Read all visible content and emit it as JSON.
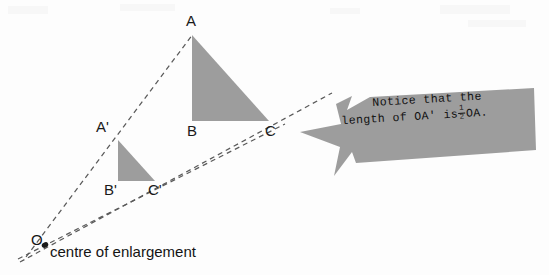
{
  "figure": {
    "background_color": "#fdfdfd",
    "shape_fill_color": "#9d9d9d",
    "line_color": "#4a4a4a",
    "text_color": "#141414"
  },
  "labels": {
    "A": "A",
    "B": "B",
    "C": "C",
    "A_prime": "A'",
    "B_prime": "B'",
    "C_prime": "C'",
    "origin": "O",
    "caption": "centre of enlargement"
  },
  "callout": {
    "line1": "Notice that the",
    "line2_before": "length of OA' is",
    "fraction_numerator": "1",
    "fraction_denominator": "2",
    "line2_after": "OA.",
    "full_text": "Notice that the length of OA' is 1/2 OA.",
    "fill_color": "#9d9d9d"
  },
  "geometry": {
    "type": "scale-diagram",
    "centre_of_enlargement": {
      "x": 44,
      "y": 245
    },
    "scale_factor": 0.5,
    "large_triangle": {
      "name": "ABC",
      "vertices": {
        "A": {
          "x": 192,
          "y": 35
        },
        "B": {
          "x": 192,
          "y": 121
        },
        "C": {
          "x": 269,
          "y": 121
        }
      }
    },
    "small_triangle": {
      "name": "A'B'C'",
      "vertices": {
        "A'": {
          "x": 118,
          "y": 140
        },
        "B'": {
          "x": 118,
          "y": 181
        },
        "C'": {
          "x": 155,
          "y": 181
        }
      }
    },
    "rays": [
      {
        "name": "ray-OA",
        "through": [
          "O",
          "A'",
          "A"
        ]
      },
      {
        "name": "ray-OB",
        "through": [
          "O",
          "B'",
          "B"
        ]
      },
      {
        "name": "ray-OC",
        "through": [
          "O",
          "C'",
          "C"
        ]
      }
    ]
  }
}
